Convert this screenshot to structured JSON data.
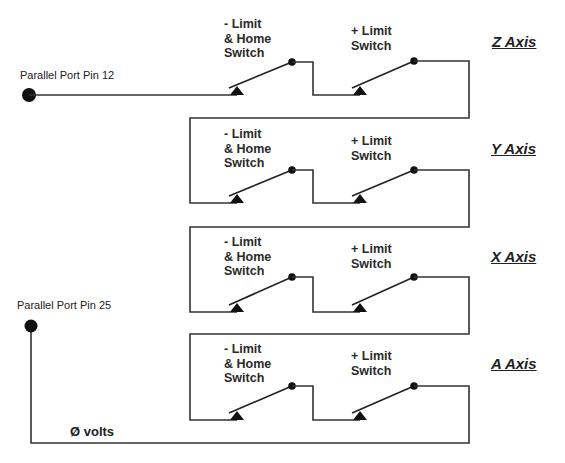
{
  "pins": {
    "pin12": {
      "label": "Parallel Port Pin 12"
    },
    "pin25": {
      "label": "Parallel Port Pin 25"
    }
  },
  "ground": {
    "label": "Ø volts"
  },
  "switch_labels": {
    "minus": "- Limit\n& Home\nSwitch",
    "plus": "+ Limit\nSwitch"
  },
  "axes": [
    {
      "name": "Z Axis",
      "minus_switch": "- Limit\n& Home\nSwitch",
      "plus_switch": "+ Limit\nSwitch"
    },
    {
      "name": "Y Axis",
      "minus_switch": "- Limit\n& Home\nSwitch",
      "plus_switch": "+ Limit\nSwitch"
    },
    {
      "name": "X Axis",
      "minus_switch": "- Limit\n& Home\nSwitch",
      "plus_switch": "+ Limit\nSwitch"
    },
    {
      "name": "A Axis",
      "minus_switch": "- Limit\n& Home\nSwitch",
      "plus_switch": "+ Limit\nSwitch"
    }
  ],
  "colors": {
    "wire": "#333333",
    "text": "#222222",
    "background": "#ffffff"
  }
}
